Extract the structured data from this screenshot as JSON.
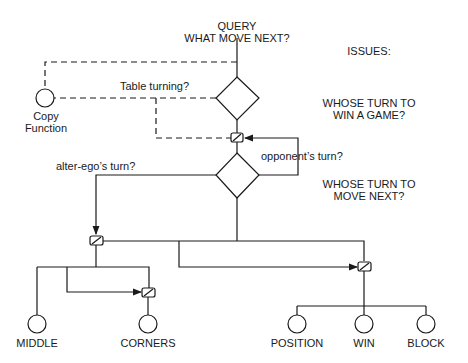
{
  "query": {
    "line1": "QUERY",
    "line2": "WHAT MOVE NEXT?"
  },
  "issues": {
    "heading": "ISSUES:",
    "issue1": {
      "line1": "WHOSE TURN TO",
      "line2": "WIN A GAME?"
    },
    "issue2": {
      "line1": "WHOSE TURN TO",
      "line2": "MOVE NEXT?"
    }
  },
  "labels": {
    "table_turning": "Table turning?",
    "copy_function_line1": "Copy",
    "copy_function_line2": "Function",
    "opponents_turn": "opponent’s turn?",
    "alter_egos_turn": "alter-ego’s turn?"
  },
  "leaves": {
    "middle": "MIDDLE",
    "corners": "CORNERS",
    "position": "POSITION",
    "win": "WIN",
    "block": "BLOCK"
  },
  "colors": {
    "ink": "#1a1a1a",
    "background": "#ffffff"
  }
}
